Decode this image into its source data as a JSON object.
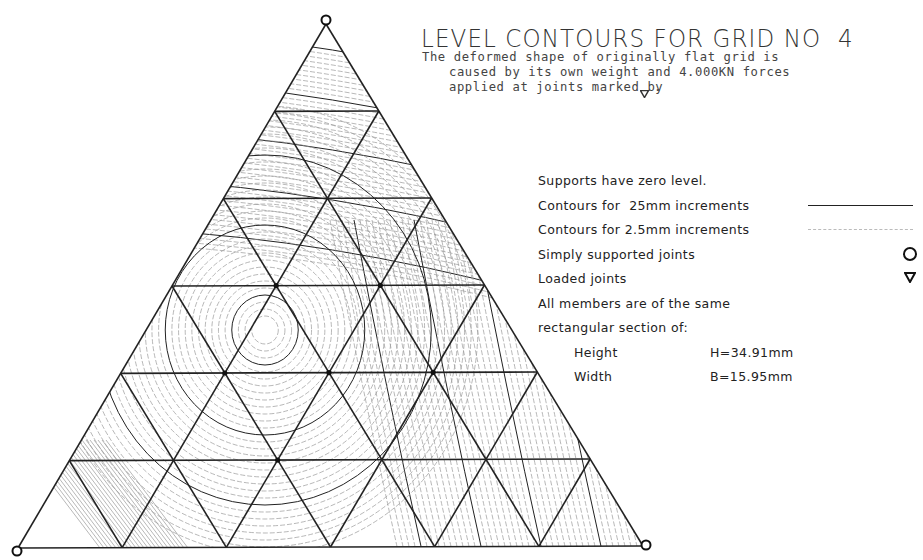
{
  "title": "LEVEL CONTOURS FOR GRID NO  4",
  "description": [
    "The deformed shape of originally flat grid is",
    "caused by its own weight and 4.000KN forces",
    "applied at joints marked by"
  ],
  "description_marker": "loaded-joint-triangle",
  "legend": {
    "supports_note": "Supports have zero level.",
    "major_contours": {
      "label": "Contours for  25mm increments",
      "style": "solid"
    },
    "minor_contours": {
      "label": "Contours for 2.5mm increments",
      "style": "dashed"
    },
    "supported_joints": {
      "label": "Simply supported joints",
      "symbol": "circle"
    },
    "loaded_joints": {
      "label": "Loaded joints",
      "symbol": "inverted-triangle"
    },
    "section_note_1": "All members are of the same",
    "section_note_2": "rectangular section of:",
    "height_label": "Height",
    "height_value": "H=34.91mm",
    "width_label": "Width",
    "width_value": "B=15.95mm"
  },
  "grid": {
    "type": "triangular",
    "subdivisions": 6,
    "vertices": {
      "apex": [
        326,
        24
      ],
      "bottom_left": [
        18,
        548
      ],
      "bottom_right": [
        643,
        546
      ]
    },
    "supports": [
      "apex",
      "bottom_left",
      "bottom_right"
    ],
    "loaded_joints_rows": [
      [
        3,
        1
      ],
      [
        3,
        2
      ],
      [
        4,
        1
      ],
      [
        4,
        2
      ],
      [
        4,
        3
      ],
      [
        5,
        2
      ]
    ]
  },
  "colors": {
    "ink": "#222222",
    "minor": "#9a9a9a",
    "background": "#ffffff"
  }
}
